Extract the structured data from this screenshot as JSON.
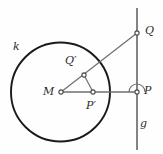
{
  "figure": {
    "type": "geometry-diagram",
    "width": 163,
    "height": 154,
    "background_color": "#fefefe",
    "stroke_color": "#3a3a3a",
    "circle_color": "#1a1a1a",
    "label_color": "#2b2b2b"
  },
  "labels": {
    "circle_k": "k",
    "center_M": "M",
    "point_Q_prime": "Q′",
    "point_P_prime": "P′",
    "point_P": "P",
    "point_Q": "Q",
    "line_g": "g"
  },
  "geometry": {
    "circle": {
      "cx": 60.5,
      "cy": 92,
      "r": 49.5,
      "stroke_width": 1.8
    },
    "line_g": {
      "x": 137,
      "y1": 8,
      "y2": 150,
      "stroke_width": 1.6
    },
    "points": [
      {
        "name": "M",
        "x": 61,
        "y": 92,
        "marker": "open-circle"
      },
      {
        "name": "P",
        "x": 137,
        "y": 92,
        "marker": "open-circle"
      },
      {
        "name": "Q",
        "x": 137,
        "y": 33,
        "marker": "open-circle"
      },
      {
        "name": "Q'",
        "x": 84,
        "y": 75,
        "marker": "open-circle"
      },
      {
        "name": "P'",
        "x": 93,
        "y": 92,
        "marker": "open-circle"
      }
    ],
    "segments": [
      {
        "name": "M-P",
        "from": "M",
        "to": "P"
      },
      {
        "name": "M-Q",
        "from": "M",
        "to": "Q"
      },
      {
        "name": "Q'-P'",
        "from": "Q'",
        "to": "P'"
      }
    ],
    "angle_marker": {
      "name": "right-angle-at-P",
      "vertex_x": 137,
      "vertex_y": 92,
      "radius": 8,
      "start_deg": 0,
      "end_deg": 180
    }
  }
}
